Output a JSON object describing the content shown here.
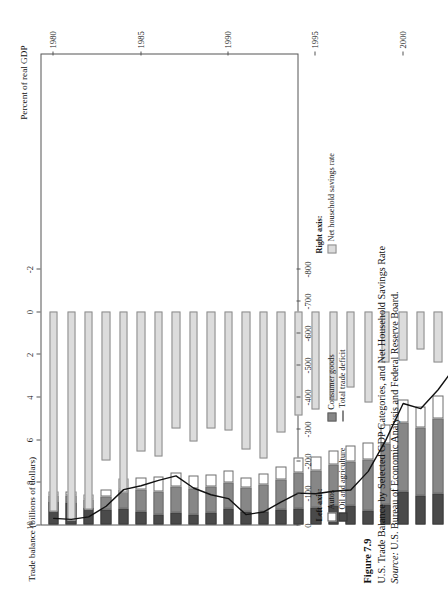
{
  "figure": {
    "number_label": "Figure 7.9",
    "title": "U.S. Trade Balance by Selected GDP Categories, and Net Household Savings Rate",
    "source_prefix": "Source:",
    "source_text": " U.S. Bureau of Economic Analysis and Federal Reserve Board."
  },
  "legend_left": {
    "title": "Left axis:",
    "items": [
      {
        "label": "Autos",
        "swatch": "autos-swatch",
        "color": "#ffffff"
      },
      {
        "label": "Oil and agriculture",
        "swatch": "oil-swatch",
        "color": "#4a4a4a"
      },
      {
        "label": "Consumer goods",
        "swatch": "consumer-goods-swatch",
        "color": "#878787"
      },
      {
        "label": "Total trade deficit",
        "swatch": "total-trade-deficit-line",
        "color": "#111111"
      }
    ]
  },
  "legend_right": {
    "title": "Right axis:",
    "items": [
      {
        "label": "Net household savings rate",
        "swatch": "savings-rate-swatch",
        "color": "#dcdcdc"
      }
    ]
  },
  "chart_data": {
    "type": "bar",
    "title": "U.S. Trade Balance by Selected GDP Categories, and Net Household Savings Rate",
    "xlabel": "",
    "ylabel": "Trade balance (billions of dollars)",
    "y2label": "Percent of real GDP",
    "grid": false,
    "legend_position": "below-axis",
    "x": [
      1980,
      1981,
      1982,
      1983,
      1984,
      1985,
      1986,
      1987,
      1988,
      1989,
      1990,
      1991,
      1992,
      1993,
      1994,
      1995,
      1996,
      1997,
      1998,
      1999,
      2000,
      2001,
      2002,
      2003,
      2004,
      2005
    ],
    "xlim": [
      1979.3,
      2006.2
    ],
    "xticks": [
      1980,
      1985,
      1990,
      1995,
      2000,
      2005
    ],
    "xticklabels": [
      "1980",
      "1985",
      "1990",
      "1995",
      "2000",
      "2005"
    ],
    "ylim": [
      -800,
      0
    ],
    "yticks": [
      0,
      -100,
      -200,
      -300,
      -400,
      -500,
      -600,
      -700,
      -800
    ],
    "yticklabels": [
      "0",
      "-100",
      "-200",
      "-300",
      "-400",
      "-500",
      "-600",
      "-700",
      "-800"
    ],
    "y2lim": [
      -2,
      10
    ],
    "y2ticks": [
      10,
      8,
      6,
      4,
      2,
      0,
      -2
    ],
    "y2ticklabels": [
      "10",
      "8",
      "6",
      "4",
      "2",
      "0",
      "-2"
    ],
    "series": [
      {
        "name": "Oil and agriculture",
        "axis": "left",
        "stack": "trade",
        "color": "#4a4a4a",
        "values": [
          -72,
          -68,
          -52,
          -46,
          -50,
          -42,
          -30,
          -36,
          -32,
          -38,
          -50,
          -40,
          -42,
          -46,
          -50,
          -52,
          -60,
          -58,
          -44,
          -64,
          -104,
          -92,
          -96,
          -114,
          -152,
          -214
        ]
      },
      {
        "name": "Consumer goods",
        "axis": "left",
        "stack": "trade",
        "color": "#878787",
        "values": [
          -18,
          -22,
          -26,
          -40,
          -60,
          -66,
          -74,
          -84,
          -80,
          -80,
          -82,
          -76,
          -84,
          -96,
          -112,
          -118,
          -126,
          -140,
          -160,
          -188,
          -216,
          -210,
          -236,
          -256,
          -294,
          -322
        ]
      },
      {
        "name": "Autos",
        "axis": "left",
        "stack": "trade",
        "color": "#ffffff",
        "values": [
          -12,
          -14,
          -16,
          -24,
          -34,
          -40,
          -46,
          -44,
          -40,
          -38,
          -38,
          -32,
          -34,
          -40,
          -46,
          -44,
          -46,
          -48,
          -52,
          -62,
          -70,
          -66,
          -72,
          -76,
          -84,
          -92
        ]
      },
      {
        "name": "Total trade deficit",
        "axis": "left",
        "type": "line",
        "color": "#111111",
        "values": [
          -19,
          -16,
          -24,
          -57,
          -109,
          -121,
          -138,
          -152,
          -114,
          -93,
          -81,
          -31,
          -39,
          -70,
          -98,
          -96,
          -104,
          -108,
          -166,
          -263,
          -378,
          -362,
          -421,
          -495,
          -609,
          -717
        ]
      },
      {
        "name": "Net household savings rate",
        "axis": "right",
        "color": "#dcdcdc",
        "values": [
          9.4,
          9.8,
          9.3,
          7.0,
          8.5,
          6.6,
          6.8,
          5.5,
          6.1,
          5.5,
          5.6,
          6.5,
          6.9,
          5.7,
          4.9,
          4.6,
          4.2,
          3.6,
          4.3,
          2.4,
          2.3,
          1.8,
          2.4,
          2.1,
          2.0,
          0.4
        ]
      }
    ]
  },
  "axis_titles": {
    "left": "Trade balance (billions of dollars)",
    "right": "Percent of real GDP"
  }
}
